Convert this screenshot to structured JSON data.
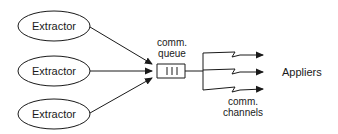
{
  "diagram": {
    "extractors": [
      {
        "label": "Extractor",
        "cx": 54,
        "cy": 26
      },
      {
        "label": "Extractor",
        "cx": 54,
        "cy": 71
      },
      {
        "label": "Extractor",
        "cx": 54,
        "cy": 114
      }
    ],
    "queue": {
      "label_line1": "comm.",
      "label_line2": "queue"
    },
    "channels": {
      "label_line1": "comm.",
      "label_line2": "channels"
    },
    "appliers": {
      "label": "Appliers"
    },
    "colors": {
      "stroke": "#1a1a1a",
      "background": "#ffffff"
    }
  }
}
